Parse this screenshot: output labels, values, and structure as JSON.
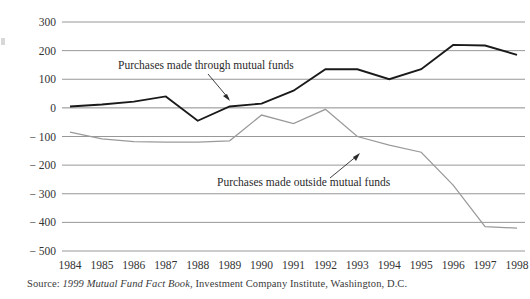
{
  "figure": {
    "source_prefix": "Source:",
    "source_italic": "1999 Mutual Fund Fact Book",
    "source_rest": ", Investment Company Institute, Washington, D.C."
  },
  "annotations": {
    "series_a_label": "Purchases made through mutual funds",
    "series_b_label": "Purchases made outside mutual funds"
  },
  "colors": {
    "series_a": "#1a1a1a",
    "series_b": "#9a9a9a",
    "gridline": "#8c8c8c",
    "axis_text": "#333333",
    "background": "#ffffff"
  },
  "chart_data": {
    "type": "line",
    "title": "",
    "xlabel": "",
    "ylabel": "",
    "ylim": [
      -500,
      300
    ],
    "yticks": [
      300,
      200,
      100,
      0,
      -100,
      -200,
      -300,
      -400,
      -500
    ],
    "ytick_labels": [
      "300",
      "200",
      "100",
      "0",
      "− 100",
      "− 200",
      "− 300",
      "− 400",
      "− 500"
    ],
    "grid": true,
    "legend_position": "inline-annotations",
    "categories": [
      "1984",
      "1985",
      "1986",
      "1987",
      "1988",
      "1989",
      "1990",
      "1991",
      "1992",
      "1993",
      "1994",
      "1995",
      "1996",
      "1997",
      "1998"
    ],
    "series": [
      {
        "name": "Purchases made through mutual funds",
        "color": "#1a1a1a",
        "values": [
          5,
          12,
          22,
          40,
          -45,
          5,
          15,
          60,
          135,
          135,
          100,
          135,
          220,
          218,
          185
        ]
      },
      {
        "name": "Purchases made outside mutual funds",
        "color": "#9a9a9a",
        "values": [
          -85,
          -108,
          -118,
          -120,
          -120,
          -115,
          -25,
          -55,
          -5,
          -100,
          -130,
          -155,
          -270,
          -415,
          -420
        ]
      }
    ]
  }
}
